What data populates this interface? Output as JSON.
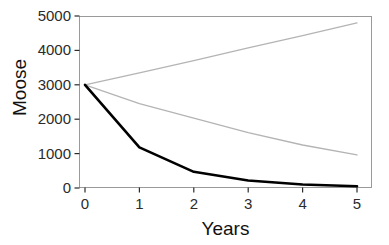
{
  "chart_data": {
    "type": "line",
    "title": "",
    "xlabel": "Years",
    "ylabel": "Moose",
    "x": [
      0,
      1,
      2,
      3,
      4,
      5
    ],
    "xlim": [
      0,
      5
    ],
    "ylim": [
      0,
      5000
    ],
    "xticks": [
      "0",
      "1",
      "2",
      "3",
      "4",
      "5"
    ],
    "yticks": [
      "0",
      "1000",
      "2000",
      "3000",
      "4000",
      "5000"
    ],
    "grid": false,
    "legend": "none",
    "series": [
      {
        "name": "upper-gray-trajectory",
        "color": "#b4b4b4",
        "width": 1.3,
        "values": [
          3000,
          3350,
          3700,
          4070,
          4430,
          4800
        ]
      },
      {
        "name": "lower-gray-trajectory",
        "color": "#b4b4b4",
        "width": 1.3,
        "values": [
          3000,
          2450,
          2030,
          1610,
          1250,
          960
        ]
      },
      {
        "name": "black-decline-trajectory",
        "color": "#000000",
        "width": 2.6,
        "values": [
          3000,
          1180,
          470,
          220,
          100,
          50
        ]
      }
    ]
  },
  "axes": {
    "panel": {
      "border_color": "#9a9a9a",
      "background": "#ffffff"
    },
    "tick_color": "#2b2b2b"
  }
}
